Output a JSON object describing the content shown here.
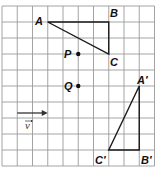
{
  "grid": {
    "cols": 10,
    "rows": 10,
    "origin_x": 2,
    "origin_y": 6,
    "cell_w": 15.25,
    "cell_h": 16,
    "line_color": "#9a9a9a"
  },
  "colors": {
    "ink": "#1a1a1a",
    "background": "#ffffff"
  },
  "triangle_original": {
    "vertices": [
      {
        "label": "A",
        "gx": 3,
        "gy": 1
      },
      {
        "label": "B",
        "gx": 7,
        "gy": 1
      },
      {
        "label": "C",
        "gx": 7,
        "gy": 3
      }
    ]
  },
  "triangle_image": {
    "vertices": [
      {
        "label": "A′",
        "gx": 9,
        "gy": 5
      },
      {
        "label": "B′",
        "gx": 9,
        "gy": 9
      },
      {
        "label": "C′",
        "gx": 7,
        "gy": 9
      }
    ]
  },
  "points": [
    {
      "label": "P",
      "gx": 5,
      "gy": 3
    },
    {
      "label": "Q",
      "gx": 5,
      "gy": 5
    }
  ],
  "vector": {
    "label": "v",
    "from": {
      "gx": 1,
      "gy": 7
    },
    "to": {
      "gx": 3,
      "gy": 7
    }
  },
  "labels": {
    "A": "A",
    "B": "B",
    "C": "C",
    "A_prime": "A′",
    "B_prime": "B′",
    "C_prime": "C′",
    "P": "P",
    "Q": "Q",
    "v": "v"
  }
}
